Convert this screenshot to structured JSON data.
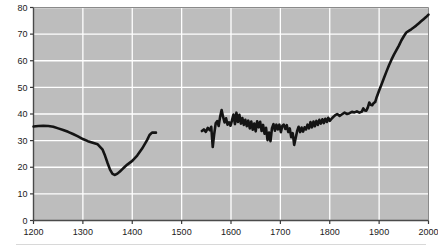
{
  "chart_data": {
    "type": "line",
    "title": "",
    "xlabel": "",
    "ylabel": "기대 수명, 년",
    "xlim": [
      1200,
      2000
    ],
    "ylim": [
      0,
      80
    ],
    "xticks": [
      1200,
      1300,
      1400,
      1500,
      1600,
      1700,
      1800,
      1900,
      2000
    ],
    "yticks": [
      0,
      10,
      20,
      30,
      40,
      50,
      60,
      70,
      80
    ],
    "grid": true,
    "legend": "none",
    "plot_background": "#bdbdbd",
    "gridline_color": "#ffffff",
    "line_color": "#141414",
    "line_width": 2.6,
    "series": [
      {
        "name": "segment-1",
        "x": [
          1200,
          1210,
          1220,
          1230,
          1240,
          1250,
          1260,
          1270,
          1280,
          1290,
          1300,
          1310,
          1320,
          1330,
          1340,
          1345,
          1350,
          1355,
          1360,
          1365,
          1370,
          1375,
          1380,
          1385,
          1390,
          1400,
          1410,
          1420,
          1430,
          1435,
          1440,
          1448
        ],
        "y": [
          35.3,
          35.5,
          35.6,
          35.5,
          35.2,
          34.6,
          34.0,
          33.3,
          32.5,
          31.6,
          30.6,
          29.8,
          29.2,
          28.6,
          26.6,
          24.3,
          21.6,
          19.1,
          17.5,
          17.1,
          17.6,
          18.4,
          19.3,
          20.2,
          21.0,
          22.4,
          24.4,
          27.0,
          30.2,
          32.1,
          33.0,
          33.0
        ]
      },
      {
        "name": "segment-2",
        "x": [
          1541,
          1545,
          1549,
          1553,
          1557,
          1560,
          1563,
          1566,
          1569,
          1572,
          1575,
          1578,
          1581,
          1584,
          1587,
          1590,
          1593,
          1596,
          1599,
          1602,
          1605,
          1608,
          1611,
          1614,
          1617,
          1620,
          1623,
          1626,
          1629,
          1632,
          1635,
          1638,
          1641,
          1644,
          1647,
          1650,
          1653,
          1656,
          1659,
          1662,
          1665,
          1668,
          1671,
          1674,
          1677,
          1680,
          1683,
          1686,
          1689,
          1692,
          1695,
          1698,
          1701,
          1704,
          1707,
          1710,
          1713,
          1716,
          1719,
          1722,
          1725,
          1728,
          1731,
          1734,
          1737,
          1740,
          1743,
          1746,
          1749,
          1752,
          1755,
          1758,
          1761,
          1764,
          1767,
          1770,
          1773,
          1776,
          1779,
          1782,
          1785,
          1788,
          1791,
          1794,
          1797,
          1800,
          1805,
          1810,
          1815,
          1820,
          1825,
          1830,
          1835,
          1840,
          1845,
          1850,
          1855,
          1860,
          1865,
          1868,
          1871,
          1874,
          1877,
          1880,
          1883,
          1886,
          1889,
          1892,
          1895,
          1900,
          1905,
          1910,
          1915,
          1920,
          1925,
          1930,
          1935,
          1940,
          1945,
          1950,
          1955,
          1960,
          1965,
          1970,
          1975,
          1980,
          1985,
          1990,
          1995,
          2000
        ],
        "y": [
          33.6,
          34.2,
          33.3,
          34.8,
          33.9,
          35.2,
          27.6,
          32.5,
          36.5,
          37.3,
          35.5,
          39.0,
          41.5,
          38.9,
          36.8,
          38.4,
          36.0,
          36.9,
          35.6,
          37.6,
          39.8,
          36.2,
          40.5,
          37.0,
          39.7,
          36.4,
          38.5,
          35.9,
          37.8,
          35.4,
          37.5,
          34.6,
          37.2,
          34.1,
          36.4,
          33.5,
          37.3,
          35.0,
          37.1,
          33.6,
          35.9,
          32.6,
          34.8,
          30.2,
          33.0,
          29.8,
          34.7,
          36.2,
          33.7,
          36.0,
          34.2,
          36.0,
          33.2,
          35.6,
          36.0,
          34.4,
          35.8,
          33.2,
          34.6,
          31.3,
          32.8,
          28.4,
          31.0,
          33.6,
          35.2,
          33.2,
          34.9,
          33.4,
          35.0,
          34.2,
          36.0,
          34.6,
          37.0,
          35.0,
          37.2,
          35.4,
          37.4,
          35.9,
          37.8,
          36.4,
          38.0,
          36.6,
          38.2,
          37.0,
          38.6,
          37.4,
          38.5,
          39.4,
          40.0,
          39.3,
          39.9,
          40.5,
          40.0,
          40.3,
          40.8,
          40.6,
          41.0,
          40.5,
          40.9,
          42.1,
          41.3,
          41.2,
          42.4,
          44.3,
          43.5,
          43.3,
          44.1,
          44.5,
          46.3,
          48.8,
          51.2,
          53.6,
          56.0,
          58.3,
          60.4,
          62.3,
          64.0,
          65.7,
          67.6,
          69.2,
          70.6,
          71.2,
          71.8,
          72.5,
          73.2,
          74.0,
          74.8,
          75.6,
          76.4,
          77.3
        ]
      }
    ]
  }
}
